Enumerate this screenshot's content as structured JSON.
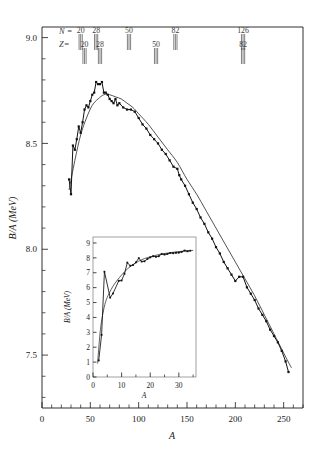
{
  "figure": {
    "name": "binding-energy-per-nucleon-curve"
  },
  "chart_data": {
    "type": "line",
    "title": "",
    "xlabel": "A",
    "ylabel": "B/A (MeV)",
    "xlim": [
      0,
      270
    ],
    "ylim": [
      7.25,
      9.05
    ],
    "grid": false,
    "legend": "none",
    "x_ticks": [
      0,
      50,
      100,
      150,
      200,
      250
    ],
    "x_tick_labels": [
      "0",
      "50",
      "100",
      "150",
      "200",
      "250"
    ],
    "x_minor_step": 10,
    "y_ticks": [
      7.5,
      8.0,
      8.5,
      9.0
    ],
    "y_tick_labels": [
      "7.5",
      "8.0",
      "8.5",
      "9.0"
    ],
    "y_minor_step": 0.1,
    "series": [
      {
        "name": "experimental",
        "style": "points-with-line",
        "x": [
          28,
          30,
          32,
          34,
          36,
          38,
          40,
          42,
          44,
          46,
          48,
          50,
          52,
          54,
          56,
          58,
          60,
          62,
          64,
          66,
          68,
          70,
          72,
          74,
          76,
          78,
          80,
          84,
          88,
          92,
          96,
          100,
          104,
          108,
          112,
          116,
          120,
          124,
          128,
          132,
          136,
          140,
          142,
          144,
          148,
          152,
          156,
          160,
          164,
          168,
          172,
          176,
          180,
          184,
          188,
          192,
          196,
          200,
          204,
          208,
          212,
          216,
          220,
          224,
          228,
          232,
          236,
          240,
          244,
          248,
          252,
          255
        ],
        "y": [
          8.33,
          8.26,
          8.49,
          8.47,
          8.52,
          8.58,
          8.55,
          8.6,
          8.66,
          8.68,
          8.67,
          8.7,
          8.73,
          8.74,
          8.79,
          8.78,
          8.78,
          8.79,
          8.74,
          8.74,
          8.73,
          8.71,
          8.7,
          8.69,
          8.71,
          8.68,
          8.69,
          8.67,
          8.66,
          8.66,
          8.65,
          8.62,
          8.59,
          8.57,
          8.54,
          8.52,
          8.5,
          8.47,
          8.45,
          8.42,
          8.39,
          8.38,
          8.35,
          8.33,
          8.3,
          8.26,
          8.22,
          8.19,
          8.15,
          8.12,
          8.08,
          8.05,
          8.01,
          7.98,
          7.94,
          7.91,
          7.88,
          7.85,
          7.87,
          7.87,
          7.82,
          7.79,
          7.76,
          7.72,
          7.69,
          7.66,
          7.62,
          7.59,
          7.56,
          7.52,
          7.47,
          7.42
        ]
      },
      {
        "name": "semi-empirical-mass-formula",
        "style": "smooth-line",
        "x": [
          28,
          34,
          40,
          46,
          52,
          58,
          64,
          70,
          76,
          82,
          88,
          94,
          100,
          110,
          120,
          130,
          140,
          150,
          160,
          170,
          180,
          190,
          200,
          210,
          220,
          230,
          240,
          250,
          258
        ],
        "y": [
          8.28,
          8.42,
          8.54,
          8.62,
          8.68,
          8.71,
          8.73,
          8.73,
          8.72,
          8.71,
          8.69,
          8.67,
          8.64,
          8.59,
          8.53,
          8.47,
          8.41,
          8.33,
          8.26,
          8.18,
          8.1,
          8.02,
          7.94,
          7.86,
          7.78,
          7.69,
          7.6,
          7.51,
          7.44
        ]
      }
    ],
    "annotations": {
      "key_N": "N =",
      "key_Z": "Z=",
      "magic_numbers_N": [
        {
          "label": "20",
          "A": 40
        },
        {
          "label": "28",
          "A": 56
        },
        {
          "label": "50",
          "A": 90
        },
        {
          "label": "82",
          "A": 138
        },
        {
          "label": "126",
          "A": 208
        }
      ],
      "magic_numbers_Z": [
        {
          "label": "20",
          "A": 44
        },
        {
          "label": "28",
          "A": 60
        },
        {
          "label": "50",
          "A": 118
        },
        {
          "label": "82",
          "A": 208
        }
      ]
    },
    "inset": {
      "type": "line",
      "xlabel": "A",
      "ylabel": "B/A (MeV)",
      "xlim": [
        0,
        36
      ],
      "ylim": [
        0,
        9.4
      ],
      "x_ticks": [
        0,
        10,
        20,
        30
      ],
      "x_tick_labels": [
        "0",
        "10",
        "20",
        "30"
      ],
      "y_ticks": [
        0,
        1,
        2,
        3,
        4,
        5,
        6,
        7,
        8,
        9
      ],
      "y_tick_labels": [
        "0",
        "1",
        "2",
        "3",
        "4",
        "5",
        "6",
        "7",
        "8",
        "9"
      ],
      "series": [
        {
          "name": "experimental",
          "style": "points-with-line",
          "x": [
            2,
            3,
            4,
            6,
            7,
            9,
            10,
            11,
            12,
            13,
            14,
            15,
            16,
            17,
            18,
            19,
            20,
            21,
            22,
            23,
            24,
            25,
            26,
            27,
            28,
            29,
            30,
            31,
            32,
            33,
            34
          ],
          "y": [
            1.11,
            2.83,
            7.07,
            5.33,
            5.61,
            6.46,
            6.48,
            6.93,
            7.68,
            7.47,
            7.52,
            7.7,
            7.98,
            7.75,
            7.77,
            7.92,
            8.03,
            8.11,
            8.07,
            8.11,
            8.26,
            8.22,
            8.26,
            8.33,
            8.31,
            8.34,
            8.35,
            8.4,
            8.49,
            8.44,
            8.48
          ]
        },
        {
          "name": "semi-empirical-mass-formula",
          "style": "smooth-line",
          "x": [
            1.6,
            2,
            2.6,
            3.4,
            4.4,
            5.6,
            7,
            8.5,
            10,
            12,
            14,
            16,
            18,
            20,
            23,
            26,
            29,
            32,
            35
          ],
          "y": [
            0.9,
            1.9,
            3.2,
            4.2,
            5.05,
            5.6,
            6.1,
            6.5,
            6.85,
            7.25,
            7.55,
            7.78,
            7.95,
            8.07,
            8.22,
            8.32,
            8.4,
            8.46,
            8.5
          ]
        }
      ]
    }
  }
}
